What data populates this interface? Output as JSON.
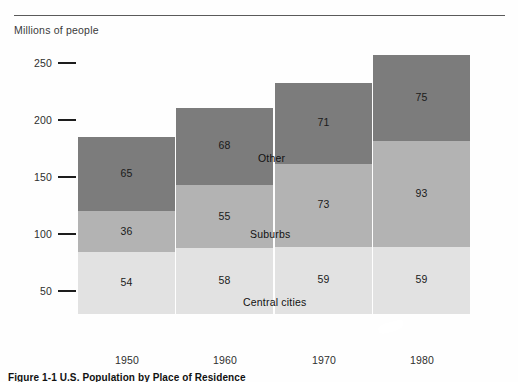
{
  "axis_title": "Millions of people",
  "caption": "Figure 1-1 U.S. Population by Place of Residence",
  "colors": {
    "other": "#7c7c7c",
    "suburbs": "#b3b3b3",
    "central_cities": "#e2e2e2",
    "rule": "#5a5a5a",
    "baseline": "#1d1d1d",
    "text": "#2e2e2e"
  },
  "series_labels": {
    "other": "Other",
    "suburbs": "Suburbs",
    "central_cities": "Central cities"
  },
  "chart_data": {
    "type": "bar",
    "subtype": "stacked",
    "title": "Figure 1-1 U.S. Population by Place of Residence",
    "xlabel": "",
    "ylabel": "Millions of people",
    "ylim": [
      0,
      265
    ],
    "yticks": [
      50,
      100,
      150,
      200,
      250
    ],
    "ytick_labels": [
      "50",
      "100",
      "150",
      "200",
      "250"
    ],
    "grid": false,
    "legend": "in-plot-annotations",
    "categories": [
      "1950",
      "1960",
      "1970",
      "1980"
    ],
    "series": [
      {
        "name": "Central cities",
        "color": "#e2e2e2",
        "values": [
          54,
          58,
          59,
          59
        ]
      },
      {
        "name": "Suburbs",
        "color": "#b3b3b3",
        "values": [
          36,
          55,
          73,
          93
        ]
      },
      {
        "name": "Other",
        "color": "#7c7c7c",
        "values": [
          65,
          68,
          71,
          75
        ]
      }
    ],
    "totals": [
      155,
      181,
      203,
      227
    ]
  }
}
